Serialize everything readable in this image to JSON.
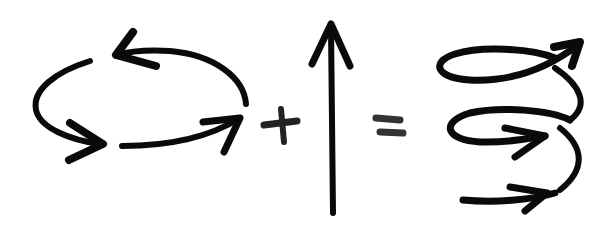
{
  "diagram": {
    "type": "equation-illustration",
    "description": "circular motion + linear upward motion = helical motion",
    "stroke_color": "#0a0a0a",
    "background": "#ffffff",
    "terms": [
      {
        "id": "circular-motion",
        "label": "circular rotation (counter-clockwise arrows)",
        "arrowheads": 3
      },
      {
        "id": "plus",
        "label": "+"
      },
      {
        "id": "linear-motion",
        "label": "upward vertical arrow"
      },
      {
        "id": "equals",
        "label": "="
      },
      {
        "id": "helix-motion",
        "label": "spiral / helix with arrows",
        "turns": 3
      }
    ]
  }
}
